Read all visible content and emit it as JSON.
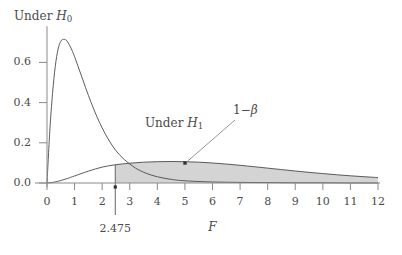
{
  "chart_data": {
    "type": "line",
    "title": "",
    "xlabel": "F",
    "ylabel": "",
    "xlim": [
      0,
      12
    ],
    "ylim": [
      0.0,
      0.78
    ],
    "grid": false,
    "legend_position": "inline-annotations",
    "xticks": [
      "0",
      "1",
      "2",
      "3",
      "4",
      "5",
      "6",
      "7",
      "8",
      "9",
      "10",
      "11",
      "12"
    ],
    "xtick_values": [
      0,
      1,
      2,
      3,
      4,
      5,
      6,
      7,
      8,
      9,
      10,
      11,
      12
    ],
    "yticks": [
      "0.0",
      "0.2",
      "0.4",
      "0.6"
    ],
    "ytick_values": [
      0.0,
      0.2,
      0.4,
      0.6
    ],
    "series": [
      {
        "name": "Under H0",
        "label": "Under H",
        "label_subscript": "0",
        "description": "Central F density under the null hypothesis",
        "filled": false,
        "x": [
          0.0,
          0.1,
          0.2,
          0.3,
          0.4,
          0.5,
          0.6,
          0.7,
          0.8,
          0.9,
          1.0,
          1.2,
          1.4,
          1.6,
          1.8,
          2.0,
          2.2,
          2.475,
          2.8,
          3.2,
          3.6,
          4.0,
          4.5,
          5.0,
          6.0,
          7.0,
          8.0,
          9.0,
          10.0,
          11.0,
          12.0
        ],
        "y": [
          0.0,
          0.255,
          0.445,
          0.58,
          0.665,
          0.705,
          0.715,
          0.71,
          0.69,
          0.662,
          0.628,
          0.552,
          0.474,
          0.4,
          0.333,
          0.274,
          0.223,
          0.165,
          0.117,
          0.075,
          0.048,
          0.031,
          0.018,
          0.011,
          0.005,
          0.003,
          0.002,
          0.001,
          0.001,
          0.0,
          0.0
        ]
      },
      {
        "name": "Under H1",
        "label": "Under H",
        "label_subscript": "1",
        "description": "Noncentral F density under the alternative hypothesis",
        "filled": true,
        "fill_from_x": 2.475,
        "fill_color": "#d4d4d4",
        "x": [
          0.0,
          0.25,
          0.5,
          0.75,
          1.0,
          1.5,
          2.0,
          2.475,
          3.0,
          3.5,
          4.0,
          4.5,
          5.0,
          5.5,
          6.0,
          6.5,
          7.0,
          7.5,
          8.0,
          8.5,
          9.0,
          9.5,
          10.0,
          10.5,
          11.0,
          11.5,
          12.0
        ],
        "y": [
          0.0,
          0.004,
          0.012,
          0.023,
          0.035,
          0.059,
          0.079,
          0.0905,
          0.0985,
          0.1035,
          0.106,
          0.1068,
          0.106,
          0.1036,
          0.0995,
          0.0942,
          0.088,
          0.0812,
          0.074,
          0.0668,
          0.0597,
          0.053,
          0.0468,
          0.041,
          0.0358,
          0.0312,
          0.027
        ]
      }
    ],
    "annotations": [
      {
        "id": "under-h0",
        "text": "Under H",
        "subscript": "0",
        "x_px": 14,
        "y_px": 10
      },
      {
        "id": "under-h1",
        "text": "Under H",
        "subscript": "1",
        "x_px": 145,
        "y_px": 117
      },
      {
        "id": "power",
        "text": "1−β",
        "x_px": 233,
        "y_px": 104,
        "pointer_to_x": 5.0,
        "pointer_to_y": 0.1
      }
    ],
    "critical_value": {
      "label": "2.475",
      "value": 2.475,
      "line_color": "#555555"
    },
    "axis_color": "#8a8a8a",
    "curve_color": "#4a4a4a"
  }
}
